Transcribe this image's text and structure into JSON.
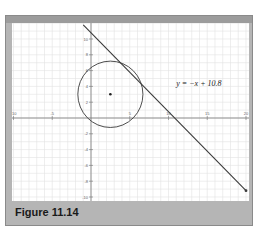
{
  "caption": "Figure 11.14",
  "chart_data": {
    "type": "line",
    "title": "",
    "xlabel": "",
    "ylabel": "",
    "xlim": [
      -10,
      20
    ],
    "ylim": [
      -10,
      12
    ],
    "grid": true,
    "x_ticks": [
      -10,
      -5,
      5,
      10,
      15,
      20
    ],
    "y_ticks": [
      -10,
      -8,
      -6,
      -4,
      -2,
      2,
      4,
      6,
      8,
      10
    ],
    "x_tick_labels": [
      "-10",
      "-5",
      "5",
      "10",
      "15",
      "20"
    ],
    "y_tick_labels": [
      "-10",
      "-8",
      "-6",
      "-4",
      "-2",
      "2",
      "4",
      "6",
      "8",
      "10"
    ],
    "series": [
      {
        "name": "y = -x + 10.8",
        "type": "line",
        "slope": -1,
        "intercept": 10.8,
        "x": [
          -1,
          20
        ],
        "y": [
          11.8,
          -9.2
        ]
      },
      {
        "name": "circle",
        "type": "circle",
        "center": [
          2.5,
          3
        ],
        "radius": 4.2
      }
    ],
    "points": [
      {
        "label": "center",
        "x": 2.5,
        "y": 3
      }
    ],
    "annotations": [
      {
        "text": "y = −x + 10.8",
        "x": 11,
        "y": 4
      }
    ]
  },
  "annotation_label": "y = −x + 10.8",
  "colors": {
    "frame": "#b5b5b5",
    "grid": "#e2e2e2",
    "axis": "#777777",
    "curve": "#3a3a3a"
  }
}
